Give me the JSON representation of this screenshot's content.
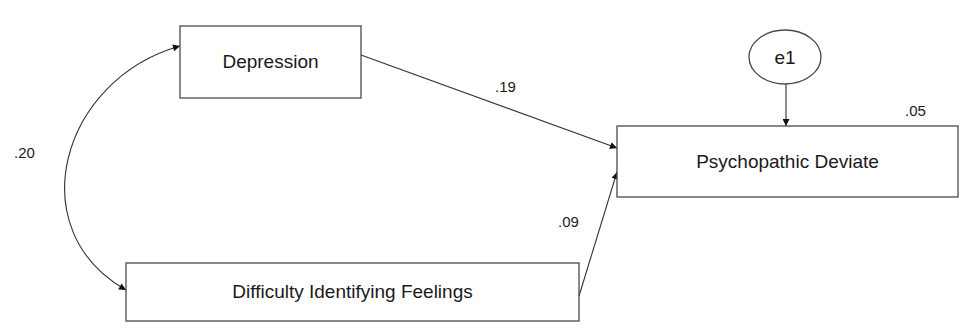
{
  "diagram": {
    "type": "path-diagram",
    "nodes": {
      "depression": {
        "label": "Depression",
        "kind": "observed"
      },
      "dif": {
        "label": "Difficulty Identifying Feelings",
        "kind": "observed"
      },
      "psych": {
        "label": "Psychopathic Deviate",
        "kind": "observed",
        "r_squared": ".05"
      },
      "e1": {
        "label": "e1",
        "kind": "error"
      }
    },
    "paths": [
      {
        "from": "Depression",
        "to": "Psychopathic Deviate",
        "coefficient": ".19",
        "type": "regression"
      },
      {
        "from": "Difficulty Identifying Feelings",
        "to": "Psychopathic Deviate",
        "coefficient": ".09",
        "type": "regression"
      },
      {
        "from": "e1",
        "to": "Psychopathic Deviate",
        "coefficient": "",
        "type": "error"
      }
    ],
    "covariances": [
      {
        "between": [
          "Depression",
          "Difficulty Identifying Feelings"
        ],
        "coefficient": ".20"
      }
    ],
    "colors": {
      "stroke": "#333333",
      "text": "#1a1a1a",
      "background": "#ffffff"
    }
  }
}
